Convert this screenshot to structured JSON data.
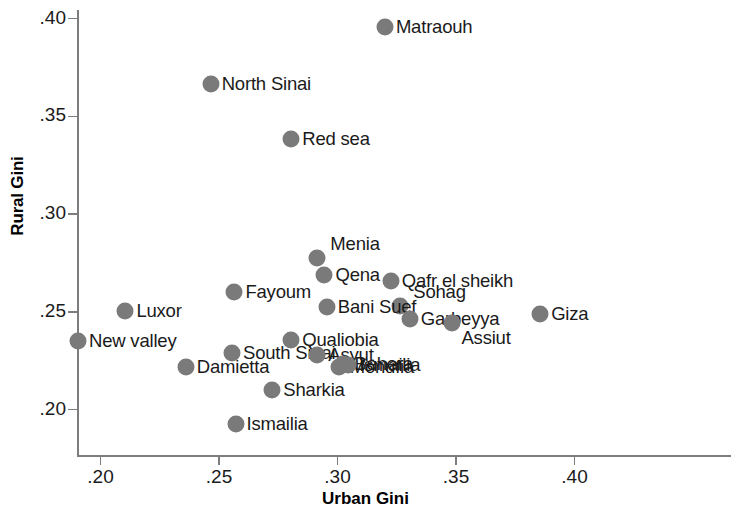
{
  "chart_data": {
    "type": "scatter",
    "title": "",
    "xlabel": "Urban Gini",
    "ylabel": "Rural Gini",
    "xlim": [
      0.185,
      0.412
    ],
    "ylim": [
      0.185,
      0.408
    ],
    "xticks": [
      ".20",
      ".25",
      ".30",
      ".35",
      ".40"
    ],
    "xtick_values": [
      0.2,
      0.25,
      0.3,
      0.35,
      0.4
    ],
    "yticks": [
      ".20",
      ".25",
      ".30",
      ".35",
      ".40"
    ],
    "ytick_values": [
      0.2,
      0.25,
      0.3,
      0.35,
      0.4
    ],
    "grid": false,
    "legend": "none",
    "marker_color": "#7a7a7a",
    "axis_color": "#7d7d7d",
    "points": [
      {
        "name": "Matraouh",
        "x": 0.32,
        "y": 0.3955,
        "label_side": "right"
      },
      {
        "name": "North Sinai",
        "x": 0.2465,
        "y": 0.3665,
        "label_side": "right"
      },
      {
        "name": "Red sea",
        "x": 0.2805,
        "y": 0.3385,
        "label_side": "right"
      },
      {
        "name": "Menia",
        "x": 0.2915,
        "y": 0.2775,
        "label_side": "right-up"
      },
      {
        "name": "Qena",
        "x": 0.2945,
        "y": 0.269,
        "label_side": "right"
      },
      {
        "name": "Qafr el sheikh",
        "x": 0.3225,
        "y": 0.2655,
        "label_side": "right"
      },
      {
        "name": "Fayoum",
        "x": 0.2565,
        "y": 0.26,
        "label_side": "right"
      },
      {
        "name": "Sohag",
        "x": 0.3265,
        "y": 0.253,
        "label_side": "right-up"
      },
      {
        "name": "Bani Suef",
        "x": 0.2955,
        "y": 0.2525,
        "label_side": "right"
      },
      {
        "name": "Luxor",
        "x": 0.2105,
        "y": 0.2505,
        "label_side": "right"
      },
      {
        "name": "Giza",
        "x": 0.3855,
        "y": 0.249,
        "label_side": "right"
      },
      {
        "name": "Garbeyya",
        "x": 0.3305,
        "y": 0.2465,
        "label_side": "right"
      },
      {
        "name": "Assiut",
        "x": 0.3485,
        "y": 0.244,
        "label_side": "right-down"
      },
      {
        "name": "Qualiobia",
        "x": 0.2805,
        "y": 0.2355,
        "label_side": "right"
      },
      {
        "name": "New valley",
        "x": 0.1905,
        "y": 0.235,
        "label_side": "right"
      },
      {
        "name": "South Sinai",
        "x": 0.2555,
        "y": 0.229,
        "label_side": "right"
      },
      {
        "name": "Asyut",
        "x": 0.2915,
        "y": 0.228,
        "label_side": "right"
      },
      {
        "name": "Monufia",
        "x": 0.3005,
        "y": 0.2215,
        "label_side": "right"
      },
      {
        "name": "Behera",
        "x": 0.3025,
        "y": 0.2235,
        "label_side": "right"
      },
      {
        "name": "Ismailia2",
        "x": 0.3045,
        "y": 0.223,
        "label_side": "right"
      },
      {
        "name": "Damietta",
        "x": 0.236,
        "y": 0.2215,
        "label_side": "right"
      },
      {
        "name": "Sharkia",
        "x": 0.2725,
        "y": 0.21,
        "label_side": "right"
      },
      {
        "name": "Ismailia",
        "x": 0.257,
        "y": 0.1925,
        "label_side": "right"
      }
    ],
    "point_labels": [
      "Matraouh",
      "North Sinai",
      "Red sea",
      "Menia",
      "Qena",
      "Qafr el sheikh",
      "Fayoum",
      "Sohag",
      "Bani Suef",
      "Luxor",
      "Giza",
      "Garbeyya",
      "Assiut",
      "Qualiobia",
      "New valley",
      "South Sinai",
      "Asyut",
      "Monufia",
      "Behera",
      "Ismailia",
      "Damietta",
      "Sharkia",
      "Ismailia"
    ]
  }
}
